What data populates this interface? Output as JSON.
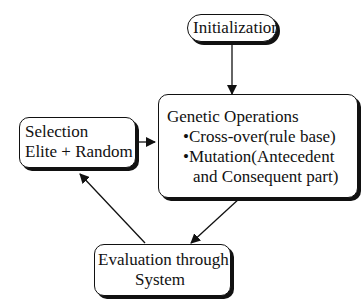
{
  "diagram": {
    "nodes": {
      "initialization": {
        "label": "Initialization"
      },
      "genetic_operations": {
        "title": "Genetic Operations",
        "bullets": [
          "•Cross-over(rule base)",
          "•Mutation(Antecedent",
          "and Consequent part)"
        ]
      },
      "selection": {
        "line1": "Selection",
        "line2": "Elite + Random"
      },
      "evaluation": {
        "line1": "Evaluation through",
        "line2": "System"
      }
    },
    "edges": [
      {
        "from": "initialization",
        "to": "genetic_operations"
      },
      {
        "from": "selection",
        "to": "genetic_operations"
      },
      {
        "from": "genetic_operations",
        "to": "evaluation"
      },
      {
        "from": "evaluation",
        "to": "selection"
      }
    ]
  }
}
